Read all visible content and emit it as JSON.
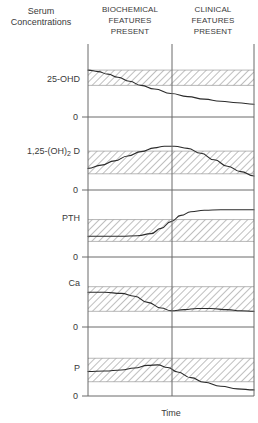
{
  "figure": {
    "y_axis_title_line1": "Serum",
    "y_axis_title_line2": "Concentrations",
    "x_axis_title": "Time",
    "phases": [
      {
        "line1": "BIOCHEMICAL",
        "line2": "FEATURES",
        "line3": "PRESENT"
      },
      {
        "line1": "CLINICAL",
        "line2": "FEATURES",
        "line3": "PRESENT"
      }
    ],
    "zero_label": "0",
    "colors": {
      "axis": "#6b6b6b",
      "curve": "#2b2b2b",
      "band_fill": "#ffffff",
      "band_hatch": "#8a8a8a",
      "text": "#3a3a3a"
    }
  },
  "chart_data": {
    "type": "line",
    "xlabel": "Time",
    "ylabel": "Serum Concentrations",
    "xlim": [
      0,
      100
    ],
    "grid": false,
    "legend": false,
    "annotations": [
      "BIOCHEMICAL FEATURES PRESENT",
      "CLINICAL FEATURES PRESENT"
    ],
    "phase_boundary_x": 50,
    "panels": [
      {
        "name": "25-OHD",
        "label": "25-OHD",
        "ylim": [
          0,
          100
        ],
        "normal_range": [
          62,
          92
        ],
        "zero_tick": "0",
        "x": [
          0,
          6,
          12,
          18,
          25,
          32,
          40,
          50,
          60,
          70,
          80,
          90,
          100
        ],
        "values": [
          92,
          89,
          84,
          78,
          70,
          62,
          55,
          46,
          40,
          35,
          31,
          28,
          25
        ]
      },
      {
        "name": "1,25-(OH)2D",
        "label": "1,25-(OH)₂ D",
        "ylim": [
          0,
          100
        ],
        "normal_range": [
          30,
          72
        ],
        "zero_tick": "0",
        "x": [
          0,
          8,
          16,
          24,
          32,
          40,
          46,
          52,
          60,
          68,
          76,
          84,
          92,
          100
        ],
        "values": [
          40,
          46,
          54,
          63,
          71,
          78,
          81,
          81,
          77,
          68,
          56,
          44,
          34,
          26
        ]
      },
      {
        "name": "PTH",
        "label": "PTH",
        "ylim": [
          0,
          100
        ],
        "normal_range": [
          30,
          72
        ],
        "zero_tick": "0",
        "x": [
          0,
          10,
          20,
          30,
          38,
          44,
          50,
          56,
          62,
          70,
          80,
          90,
          100
        ],
        "values": [
          40,
          40,
          40,
          41,
          45,
          55,
          68,
          80,
          87,
          90,
          91,
          91,
          91
        ]
      },
      {
        "name": "Ca",
        "label": "Ca",
        "ylim": [
          0,
          100
        ],
        "normal_range": [
          28,
          72
        ],
        "zero_tick": "0",
        "x": [
          0,
          10,
          20,
          28,
          36,
          44,
          50,
          58,
          66,
          74,
          84,
          92,
          100
        ],
        "values": [
          62,
          62,
          60,
          55,
          44,
          34,
          29,
          31,
          33,
          33,
          31,
          29,
          28
        ]
      },
      {
        "name": "P",
        "label": "P",
        "ylim": [
          0,
          100
        ],
        "normal_range": [
          28,
          74
        ],
        "zero_tick": "0",
        "x": [
          0,
          10,
          20,
          28,
          36,
          42,
          48,
          54,
          62,
          70,
          80,
          90,
          100
        ],
        "values": [
          48,
          49,
          51,
          55,
          60,
          61,
          56,
          47,
          36,
          27,
          19,
          14,
          12
        ]
      }
    ]
  }
}
